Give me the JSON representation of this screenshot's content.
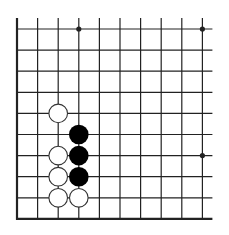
{
  "diagram": {
    "type": "go-board-fragment",
    "grid": {
      "columns": 10,
      "rows": 10,
      "origin_x": 17,
      "origin_y": 29,
      "spacing_x": 20.6,
      "spacing_y": 21.1,
      "left_edge": true,
      "bottom_edge": true,
      "top_open": true,
      "right_open": true
    },
    "star_points": [
      {
        "col": 3,
        "row": 0
      },
      {
        "col": 9,
        "row": 0
      },
      {
        "col": 9,
        "row": 6
      }
    ],
    "stones": [
      {
        "color": "white",
        "col": 2,
        "row": 4
      },
      {
        "color": "black",
        "col": 3,
        "row": 5
      },
      {
        "color": "white",
        "col": 2,
        "row": 6
      },
      {
        "color": "black",
        "col": 3,
        "row": 6
      },
      {
        "color": "white",
        "col": 2,
        "row": 7
      },
      {
        "color": "black",
        "col": 3,
        "row": 7
      },
      {
        "color": "white",
        "col": 2,
        "row": 8
      },
      {
        "color": "white",
        "col": 3,
        "row": 8
      }
    ],
    "colors": {
      "line": "#222222",
      "black_stone": "#000000",
      "white_stone_fill": "#ffffff",
      "white_stone_stroke": "#333333",
      "background": "#ffffff"
    }
  }
}
